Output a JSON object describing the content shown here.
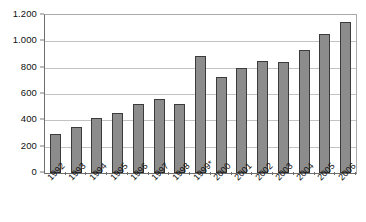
{
  "chart_data": {
    "type": "bar",
    "title": "",
    "subtitle": "",
    "xlabel": "",
    "ylabel": "",
    "categories": [
      "1992",
      "1993",
      "1994",
      "1995",
      "1996",
      "1997",
      "1998",
      "1999*",
      "2000",
      "2001",
      "2002",
      "2003",
      "2004",
      "2005",
      "2006"
    ],
    "values": [
      300,
      350,
      415,
      455,
      525,
      565,
      525,
      890,
      730,
      800,
      850,
      840,
      935,
      1055,
      1145
    ],
    "series": [
      {
        "name": "",
        "values": [
          300,
          350,
          415,
          455,
          525,
          565,
          525,
          890,
          730,
          800,
          850,
          840,
          935,
          1055,
          1145
        ]
      }
    ],
    "ylim": [
      0,
      1200
    ],
    "y_ticks": [
      0,
      200,
      400,
      600,
      800,
      1000,
      1200
    ],
    "y_tick_labels": [
      "0",
      "200",
      "400",
      "600",
      "800",
      "1.000",
      "1.200"
    ],
    "grid": true,
    "grid_axis": "y",
    "legend": false,
    "legend_position": "none",
    "bar_fill_color": "#8c8c8c",
    "bar_border_color": "#3b3b3b",
    "gridline_color": "#c3c3c3",
    "axis_color": "#6f6f6f",
    "background_color": "#ffffff",
    "x_tick_label_rotation": -45,
    "annotations": [
      "* asterisk on 1999 category label"
    ]
  }
}
